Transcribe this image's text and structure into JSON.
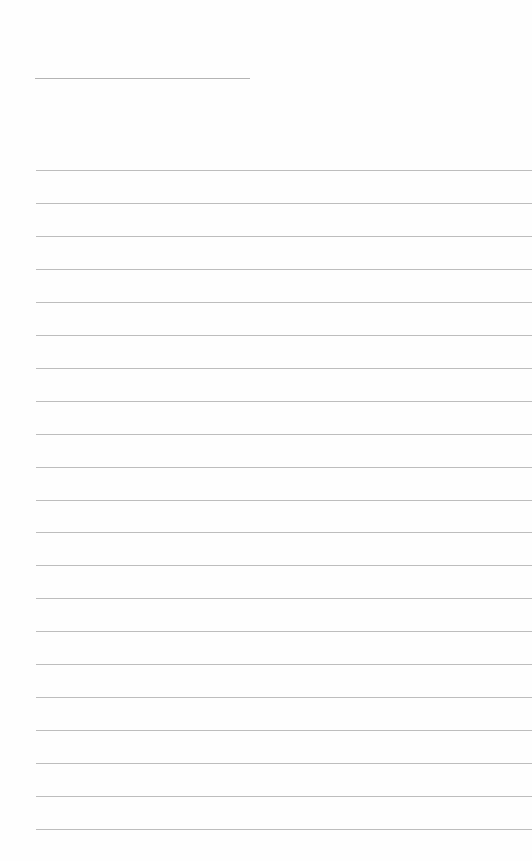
{
  "page": {
    "type": "lined-paper",
    "background_color": "#ffffff",
    "line_color": "#bdbdbd",
    "title_line": {
      "left": 35,
      "top": 78,
      "width": 215
    },
    "rules": {
      "count": 21,
      "first_top": 170,
      "spacing": 32.95,
      "left": 36
    },
    "text": []
  }
}
